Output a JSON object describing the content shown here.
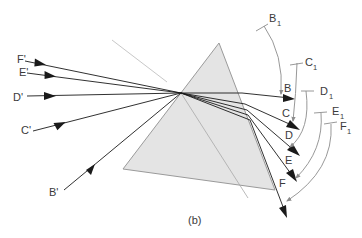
{
  "figure": {
    "caption": "(b)",
    "colors": {
      "prism_fill": "#e4e4e4",
      "prism_edge": "#9a9a9a",
      "ray": "#1a1a1a",
      "normal_line": "#c4c4c4",
      "arc": "#8c8c8c",
      "label": "#3a3a3a"
    }
  },
  "incident_rays": [
    {
      "label": "F'"
    },
    {
      "label": "E'"
    },
    {
      "label": "D'"
    },
    {
      "label": "C'"
    },
    {
      "label": "B'"
    }
  ],
  "emergent_rays": [
    {
      "label": "B"
    },
    {
      "label": "C"
    },
    {
      "label": "D"
    },
    {
      "label": "E"
    },
    {
      "label": "F"
    }
  ],
  "arcs": [
    {
      "label": "B",
      "subscript": "1"
    },
    {
      "label": "C",
      "subscript": "1"
    },
    {
      "label": "D",
      "subscript": "1"
    },
    {
      "label": "E",
      "subscript": "1"
    },
    {
      "label": "F",
      "subscript": "1"
    }
  ]
}
